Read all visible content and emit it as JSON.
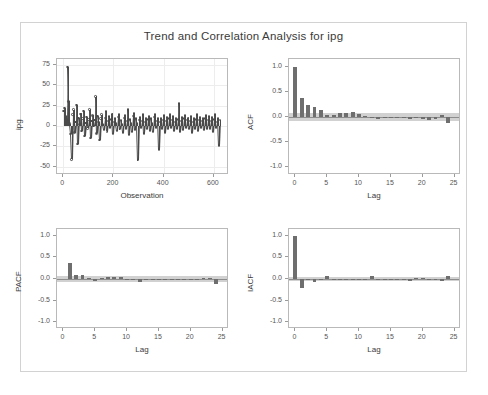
{
  "figure": {
    "title": "Trend and Correlation Analysis for ipg",
    "background_color": "#ffffff",
    "frame_color": "#d2d2d2",
    "bar_color": "#6e6e6e",
    "confidence_band_color": "#c9c9c9",
    "series_color": "#4a4a4a"
  },
  "chart_data": [
    {
      "type": "line",
      "panel": "series",
      "title": "",
      "xlabel": "Observation",
      "ylabel": "ipg",
      "xlim": [
        -25,
        660
      ],
      "ylim": [
        -60,
        82
      ],
      "xticks": [
        0,
        200,
        400,
        600
      ],
      "yticks": [
        75,
        50,
        25,
        0,
        -25,
        -50
      ],
      "xticklabels": [
        "0",
        "200",
        "400",
        "600"
      ],
      "yticklabels": [
        "75",
        "50",
        "25",
        "0",
        "-25",
        "-50"
      ],
      "grid": true,
      "legend": "none",
      "marker": "circle",
      "x": [
        1,
        5,
        9,
        13,
        17,
        21,
        25,
        29,
        33,
        37,
        41,
        45,
        49,
        53,
        57,
        61,
        65,
        69,
        73,
        77,
        81,
        85,
        89,
        93,
        97,
        101,
        105,
        109,
        113,
        117,
        121,
        125,
        129,
        133,
        137,
        141,
        145,
        149,
        153,
        157,
        161,
        165,
        169,
        173,
        177,
        181,
        185,
        189,
        193,
        197,
        201,
        205,
        209,
        213,
        217,
        221,
        225,
        229,
        233,
        237,
        241,
        245,
        249,
        253,
        257,
        261,
        265,
        269,
        273,
        277,
        281,
        285,
        289,
        293,
        297,
        301,
        305,
        309,
        313,
        317,
        321,
        325,
        329,
        333,
        337,
        341,
        345,
        349,
        353,
        357,
        361,
        365,
        369,
        373,
        377,
        381,
        385,
        389,
        393,
        397,
        401,
        405,
        409,
        413,
        417,
        421,
        425,
        429,
        433,
        437,
        441,
        445,
        449,
        453,
        457,
        461,
        465,
        469,
        473,
        477,
        481,
        485,
        489,
        493,
        497,
        501,
        505,
        509,
        513,
        517,
        521,
        525,
        529,
        533,
        537,
        541,
        545,
        549,
        553,
        557,
        561,
        565,
        569,
        573,
        577,
        581,
        585,
        589,
        593,
        597,
        601,
        605,
        609,
        613,
        617,
        621,
        625
      ],
      "y": [
        18,
        22,
        12,
        6,
        72,
        30,
        3,
        -10,
        -41,
        14,
        20,
        -8,
        5,
        26,
        -22,
        10,
        2,
        15,
        -6,
        9,
        18,
        -12,
        4,
        11,
        -3,
        8,
        20,
        -15,
        6,
        13,
        0,
        7,
        36,
        -9,
        12,
        5,
        -17,
        9,
        14,
        2,
        -5,
        10,
        18,
        -7,
        6,
        12,
        -2,
        8,
        15,
        -10,
        5,
        9,
        3,
        -6,
        11,
        14,
        -4,
        7,
        2,
        -8,
        10,
        13,
        -3,
        6,
        20,
        -11,
        8,
        4,
        -7,
        12,
        16,
        -5,
        9,
        3,
        -42,
        7,
        11,
        -2,
        6,
        14,
        -9,
        5,
        10,
        -4,
        8,
        12,
        -6,
        9,
        3,
        -7,
        11,
        15,
        -2,
        6,
        10,
        -29,
        5,
        9,
        -3,
        7,
        13,
        -8,
        6,
        11,
        -4,
        9,
        14,
        -2,
        7,
        12,
        -6,
        5,
        10,
        -3,
        8,
        28,
        -7,
        6,
        11,
        -5,
        9,
        13,
        -2,
        7,
        10,
        -4,
        6,
        12,
        -8,
        5,
        9,
        -3,
        8,
        14,
        -6,
        7,
        11,
        -2,
        6,
        10,
        -5,
        9,
        13,
        -4,
        7,
        12,
        -3,
        6,
        11,
        -7,
        8,
        14,
        -2,
        5,
        9,
        -24,
        7,
        12,
        -4,
        6,
        10,
        -3,
        8,
        13,
        -6,
        5,
        9,
        -2,
        7,
        11,
        -5,
        6,
        10,
        -4,
        8,
        12,
        -3,
        7,
        -50,
        14,
        6,
        -12,
        9,
        4,
        -38,
        11,
        3,
        -18,
        8,
        2,
        -44,
        10,
        5
      ]
    },
    {
      "type": "bar",
      "panel": "acf",
      "title": "",
      "xlabel": "Lag",
      "ylabel": "ACF",
      "xlim": [
        -1,
        26
      ],
      "ylim": [
        -1.15,
        1.15
      ],
      "xticks": [
        0,
        5,
        10,
        15,
        20,
        25
      ],
      "yticks": [
        1.0,
        0.5,
        0.0,
        -0.5,
        -1.0
      ],
      "xticklabels": [
        "0",
        "5",
        "10",
        "15",
        "20",
        "25"
      ],
      "yticklabels": [
        "1.0",
        "0.5",
        "0.0",
        "-0.5",
        "-1.0"
      ],
      "grid": false,
      "legend": "none",
      "lags": [
        0,
        1,
        2,
        3,
        4,
        5,
        6,
        7,
        8,
        9,
        10,
        11,
        12,
        13,
        14,
        15,
        16,
        17,
        18,
        19,
        20,
        21,
        22,
        23,
        24
      ],
      "values": [
        1.0,
        0.38,
        0.24,
        0.2,
        0.14,
        0.03,
        0.04,
        0.07,
        0.08,
        0.09,
        0.06,
        0.01,
        -0.02,
        -0.03,
        -0.02,
        -0.02,
        -0.02,
        -0.02,
        -0.03,
        -0.02,
        -0.03,
        -0.05,
        -0.03,
        0.04,
        -0.12
      ],
      "confidence_band": 0.08
    },
    {
      "type": "bar",
      "panel": "pacf",
      "title": "",
      "xlabel": "Lag",
      "ylabel": "PACF",
      "xlim": [
        -1,
        26
      ],
      "ylim": [
        -1.15,
        1.15
      ],
      "xticks": [
        0,
        5,
        10,
        15,
        20,
        25
      ],
      "yticks": [
        1.0,
        0.5,
        0.0,
        -0.5,
        -1.0
      ],
      "xticklabels": [
        "0",
        "5",
        "10",
        "15",
        "20",
        "25"
      ],
      "yticklabels": [
        "1.0",
        "0.5",
        "0.0",
        "-0.5",
        "-1.0"
      ],
      "grid": false,
      "legend": "none",
      "lags": [
        1,
        2,
        3,
        4,
        5,
        6,
        7,
        8,
        9,
        10,
        11,
        12,
        13,
        14,
        15,
        16,
        17,
        18,
        19,
        20,
        21,
        22,
        23,
        24
      ],
      "values": [
        0.37,
        0.1,
        0.09,
        0.02,
        -0.05,
        0.02,
        0.04,
        0.05,
        0.04,
        0.01,
        -0.03,
        -0.06,
        -0.02,
        -0.01,
        -0.01,
        0.01,
        -0.02,
        -0.03,
        -0.01,
        -0.02,
        -0.03,
        0.02,
        0.02,
        -0.12
      ],
      "confidence_band": 0.08
    },
    {
      "type": "bar",
      "panel": "iacf",
      "title": "",
      "xlabel": "Lag",
      "ylabel": "IACF",
      "xlim": [
        -1,
        26
      ],
      "ylim": [
        -1.15,
        1.15
      ],
      "xticks": [
        0,
        5,
        10,
        15,
        20,
        25
      ],
      "yticks": [
        1.0,
        0.5,
        0.0,
        -0.5,
        -1.0
      ],
      "xticklabels": [
        "0",
        "5",
        "10",
        "15",
        "20",
        "25"
      ],
      "yticklabels": [
        "1.0",
        "0.5",
        "0.0",
        "-0.5",
        "-1.0"
      ],
      "grid": false,
      "legend": "none",
      "lags": [
        0,
        1,
        2,
        3,
        4,
        5,
        6,
        7,
        8,
        9,
        10,
        11,
        12,
        13,
        14,
        15,
        16,
        17,
        18,
        19,
        20,
        21,
        22,
        23,
        24
      ],
      "values": [
        1.0,
        -0.2,
        -0.02,
        -0.06,
        -0.01,
        0.08,
        -0.01,
        -0.02,
        -0.01,
        -0.02,
        -0.02,
        -0.01,
        0.06,
        -0.01,
        -0.01,
        -0.01,
        0.01,
        -0.01,
        -0.05,
        0.03,
        0.02,
        0.01,
        -0.01,
        -0.05,
        0.07
      ],
      "confidence_band": 0.05
    }
  ]
}
